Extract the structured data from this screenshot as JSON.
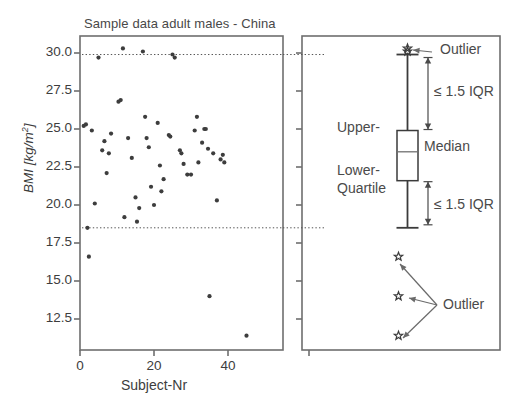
{
  "figure": {
    "title": "Sample data adult males - China",
    "panels": [
      "scatter",
      "boxplot"
    ]
  },
  "axes": {
    "ylabel_main": "BMI",
    "ylabel_unit_open": " [",
    "ylabel_unit": "kg/m",
    "ylabel_exp": "2",
    "ylabel_unit_close": "]",
    "xlabel": "Subject-Nr",
    "yticks": [
      "30.0",
      "27.5",
      "25.0",
      "22.5",
      "20.0",
      "17.5",
      "15.0",
      "12.5"
    ],
    "ytick_values": [
      30.0,
      27.5,
      25.0,
      22.5,
      20.0,
      17.5,
      15.0,
      12.5
    ],
    "xticks": [
      "0",
      "20",
      "40"
    ],
    "xtick_values": [
      0,
      20,
      40
    ],
    "ylim": [
      11.0,
      31.0
    ],
    "xlim": [
      -2,
      52
    ]
  },
  "annotations": {
    "outlier_top": "Outlier",
    "outlier_bottom": "Outlier",
    "iqr_upper": "≤ 1.5 IQR",
    "iqr_lower": "≤ 1.5 IQR",
    "upper_quartile": "Upper-",
    "lower_quartile_line1": "Lower-",
    "lower_quartile_line2": "Quartile",
    "median": "Median"
  },
  "colors": {
    "point": "#3d3d3d",
    "frame": "#6e6e6e",
    "dotted_guide": "#555555",
    "text": "#454545",
    "box_stroke": "#3b3b3b"
  },
  "chart_data": {
    "type": "scatter",
    "title": "Sample data adult males - China",
    "xlabel": "Subject-Nr",
    "ylabel": "BMI [kg/m^2]",
    "xlim": [
      -2,
      52
    ],
    "ylim": [
      11.0,
      31.0
    ],
    "grid": false,
    "legend": "none",
    "guide_lines": [
      {
        "y": 29.9,
        "style": "dotted",
        "label": "upper whisker / 1.5 IQR fence"
      },
      {
        "y": 18.5,
        "style": "dotted",
        "label": "lower whisker / 1.5 IQR fence"
      }
    ],
    "points": [
      {
        "x": 1,
        "y": 25.2
      },
      {
        "x": 1.6,
        "y": 25.3
      },
      {
        "x": 2,
        "y": 18.5
      },
      {
        "x": 2.4,
        "y": 16.6
      },
      {
        "x": 3.2,
        "y": 24.9
      },
      {
        "x": 4,
        "y": 20.1
      },
      {
        "x": 5,
        "y": 29.7
      },
      {
        "x": 6,
        "y": 23.6
      },
      {
        "x": 6.6,
        "y": 24.2
      },
      {
        "x": 7.2,
        "y": 22.1
      },
      {
        "x": 7.8,
        "y": 23.4
      },
      {
        "x": 8.4,
        "y": 24.7
      },
      {
        "x": 10.4,
        "y": 26.8
      },
      {
        "x": 11,
        "y": 26.9
      },
      {
        "x": 11.6,
        "y": 30.3
      },
      {
        "x": 12,
        "y": 19.2
      },
      {
        "x": 13,
        "y": 24.4
      },
      {
        "x": 14,
        "y": 23.1
      },
      {
        "x": 15,
        "y": 20.5
      },
      {
        "x": 15.4,
        "y": 18.9
      },
      {
        "x": 16,
        "y": 19.8
      },
      {
        "x": 17,
        "y": 30.1
      },
      {
        "x": 17.6,
        "y": 25.8
      },
      {
        "x": 18,
        "y": 24.4
      },
      {
        "x": 18.6,
        "y": 23.8
      },
      {
        "x": 19.2,
        "y": 21.2
      },
      {
        "x": 20,
        "y": 20.0
      },
      {
        "x": 21,
        "y": 25.4
      },
      {
        "x": 21.6,
        "y": 22.6
      },
      {
        "x": 22,
        "y": 20.9
      },
      {
        "x": 22.6,
        "y": 21.7
      },
      {
        "x": 24,
        "y": 24.6
      },
      {
        "x": 24.4,
        "y": 24.5
      },
      {
        "x": 25,
        "y": 29.9
      },
      {
        "x": 25.6,
        "y": 29.7
      },
      {
        "x": 27,
        "y": 23.6
      },
      {
        "x": 27.4,
        "y": 23.4
      },
      {
        "x": 28,
        "y": 22.7
      },
      {
        "x": 29,
        "y": 22.0
      },
      {
        "x": 30,
        "y": 22.0
      },
      {
        "x": 31,
        "y": 24.9
      },
      {
        "x": 31.6,
        "y": 25.8
      },
      {
        "x": 32,
        "y": 22.8
      },
      {
        "x": 33,
        "y": 24.1
      },
      {
        "x": 33.6,
        "y": 25.0
      },
      {
        "x": 34,
        "y": 25.0
      },
      {
        "x": 34.6,
        "y": 23.7
      },
      {
        "x": 35,
        "y": 14.0
      },
      {
        "x": 36,
        "y": 23.4
      },
      {
        "x": 37,
        "y": 20.3
      },
      {
        "x": 38,
        "y": 23.0
      },
      {
        "x": 38.6,
        "y": 23.3
      },
      {
        "x": 39,
        "y": 22.8
      },
      {
        "x": 45,
        "y": 11.4
      }
    ]
  },
  "boxplot_data": {
    "type": "boxplot",
    "upper_whisker": 29.9,
    "upper_quartile": 24.9,
    "median": 23.5,
    "lower_quartile": 21.6,
    "lower_whisker": 18.5,
    "outliers_high": [
      30.1,
      30.3
    ],
    "outliers_low": [
      16.6,
      14.0,
      11.4
    ]
  }
}
